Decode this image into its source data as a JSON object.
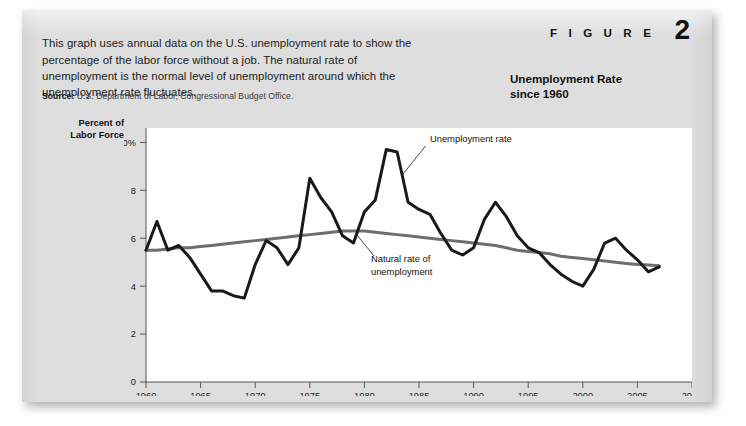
{
  "figure": {
    "label_word": "F I G U R E",
    "number": "2",
    "title_line1": "Unemployment Rate",
    "title_line2": "since 1960",
    "intro": "This graph uses annual data on the U.S. unemployment rate to show the percentage of the labor force without a job. The natural rate of unemployment is the normal level of unemployment around which the unemployment rate fluctuates.",
    "source_label": "Source:",
    "source_text": "U.S. Department of Labor, Congressional Budget Office."
  },
  "axis_title_line1": "Percent of",
  "axis_title_line2": "Labor Force",
  "colors": {
    "card_background": "#dedede",
    "plot_background": "#ffffff",
    "unemployment_rate_line": "#1a1a1a",
    "natural_rate_line": "#6e6e6e",
    "axis": "#555555",
    "text": "#111111"
  },
  "chart_data": {
    "type": "line",
    "title": "Unemployment Rate since 1960",
    "xlabel": "",
    "ylabel": "Percent of Labor Force",
    "xlim": [
      1960,
      2010
    ],
    "ylim": [
      0,
      10.6
    ],
    "xticks": [
      1960,
      1965,
      1970,
      1975,
      1980,
      1985,
      1990,
      1995,
      2000,
      2005,
      2010
    ],
    "xtick_labels": [
      "1960",
      "1965",
      "1970",
      "1975",
      "1980",
      "1985",
      "1990",
      "1995",
      "2000",
      "2005",
      "2010"
    ],
    "yticks": [
      0,
      2,
      4,
      6,
      8,
      10
    ],
    "ytick_labels": [
      "0",
      "2",
      "4",
      "6",
      "8",
      "10%"
    ],
    "grid": false,
    "legend": "inline-annotations",
    "annotations": [
      {
        "text": "Unemployment rate",
        "x": 1986,
        "y": 10.0
      },
      {
        "text": "Natural rate of",
        "x": 1980.6,
        "y": 5.0
      },
      {
        "text": "unemployment",
        "x": 1980.6,
        "y": 4.45
      }
    ],
    "x": [
      1960,
      1961,
      1962,
      1963,
      1964,
      1965,
      1966,
      1967,
      1968,
      1969,
      1970,
      1971,
      1972,
      1973,
      1974,
      1975,
      1976,
      1977,
      1978,
      1979,
      1980,
      1981,
      1982,
      1983,
      1984,
      1985,
      1986,
      1987,
      1988,
      1989,
      1990,
      1991,
      1992,
      1993,
      1994,
      1995,
      1996,
      1997,
      1998,
      1999,
      2000,
      2001,
      2002,
      2003,
      2004,
      2005,
      2006,
      2007
    ],
    "series": [
      {
        "name": "Unemployment rate",
        "color": "#1a1a1a",
        "values": [
          5.5,
          6.7,
          5.5,
          5.7,
          5.2,
          4.5,
          3.8,
          3.8,
          3.6,
          3.5,
          4.9,
          5.9,
          5.6,
          4.9,
          5.6,
          8.5,
          7.7,
          7.1,
          6.1,
          5.8,
          7.1,
          7.6,
          9.7,
          9.6,
          7.5,
          7.2,
          7.0,
          6.2,
          5.5,
          5.3,
          5.6,
          6.8,
          7.5,
          6.9,
          6.1,
          5.6,
          5.4,
          4.9,
          4.5,
          4.2,
          4.0,
          4.7,
          5.8,
          6.0,
          5.5,
          5.1,
          4.6,
          4.8
        ]
      },
      {
        "name": "Natural rate of unemployment",
        "color": "#6e6e6e",
        "values": [
          5.5,
          5.5,
          5.55,
          5.6,
          5.6,
          5.65,
          5.7,
          5.75,
          5.8,
          5.85,
          5.9,
          5.95,
          6.0,
          6.05,
          6.1,
          6.15,
          6.2,
          6.25,
          6.3,
          6.3,
          6.3,
          6.25,
          6.2,
          6.15,
          6.1,
          6.05,
          6.0,
          5.95,
          5.9,
          5.85,
          5.8,
          5.75,
          5.7,
          5.6,
          5.5,
          5.45,
          5.4,
          5.35,
          5.25,
          5.2,
          5.15,
          5.1,
          5.05,
          5.0,
          4.95,
          4.9,
          4.88,
          4.85
        ]
      }
    ]
  }
}
